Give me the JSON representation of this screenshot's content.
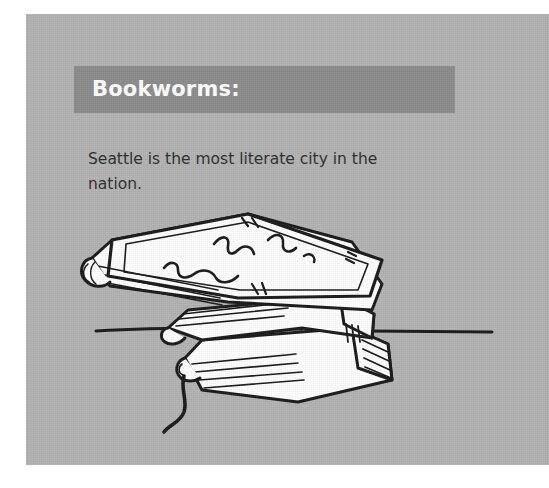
{
  "page": {
    "background_color": "#ffffff",
    "card_color": "#b3b3b3"
  },
  "card": {
    "heading": {
      "label": "Bookworms:",
      "band_color": "#8c8c8c",
      "text_color": "#ffffff"
    },
    "body": {
      "text": "Seattle is the most literate city in the nation.",
      "text_color": "#2e2e2e"
    },
    "illustration": {
      "name": "stack-of-books-sketch",
      "description": "Hand-drawn sketch of three stacked books resting on a table line, with a bookmark ribbon hanging from the bottom book and scribbled title marks on the top cover.",
      "ink_color": "#1a1a1a",
      "paper_color": "#ffffff"
    }
  }
}
